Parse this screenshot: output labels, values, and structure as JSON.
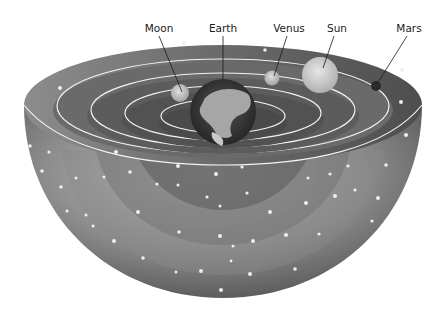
{
  "diagram": {
    "labels": [
      {
        "id": "moon",
        "text": "Moon",
        "x": 159,
        "y": 32,
        "target": [
          182,
          92
        ]
      },
      {
        "id": "earth",
        "text": "Earth",
        "x": 223,
        "y": 32,
        "target": [
          223,
          78
        ]
      },
      {
        "id": "venus",
        "text": "Venus",
        "x": 289,
        "y": 32,
        "target": [
          276,
          76
        ]
      },
      {
        "id": "sun",
        "text": "Sun",
        "x": 337,
        "y": 32,
        "target": [
          326,
          70
        ]
      },
      {
        "id": "mars",
        "text": "Mars",
        "x": 409,
        "y": 32,
        "target": [
          376,
          86
        ]
      }
    ],
    "colors": {
      "background": "#ffffff",
      "shell_dark": "#5a5a5a",
      "shell_light": "#b8b8b8",
      "orbit_line": "#f2f2f2",
      "earth_ocean": "#3c3c3c",
      "earth_land": "#a6a6a6"
    }
  }
}
